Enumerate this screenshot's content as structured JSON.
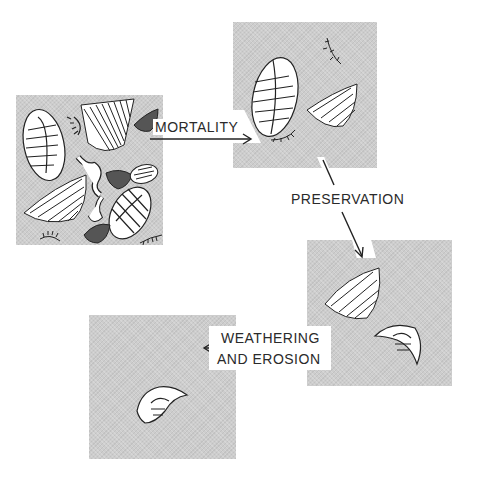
{
  "diagram": {
    "stages": [
      {
        "id": "living_community",
        "description": "Living community: trilobites, brachiopods and worms"
      },
      {
        "id": "death_assemblage",
        "description": "After mortality: fewer organisms remain"
      },
      {
        "id": "fossil_assemblage",
        "description": "After preservation: brachiopod and trilobite fragment"
      },
      {
        "id": "sample",
        "description": "After weathering and erosion: single trilobite fragment"
      }
    ],
    "arrows": {
      "mortality": {
        "label": "MORTALITY"
      },
      "preservation": {
        "label": "PRESERVATION"
      },
      "weathering": {
        "line1": "WEATHERING",
        "line2": "AND EROSION"
      }
    }
  },
  "colors": {
    "background": "#ffffff",
    "panel": "#cdcdcd",
    "ink": "#2a2a2a",
    "fossil_fill": "#ffffff"
  }
}
